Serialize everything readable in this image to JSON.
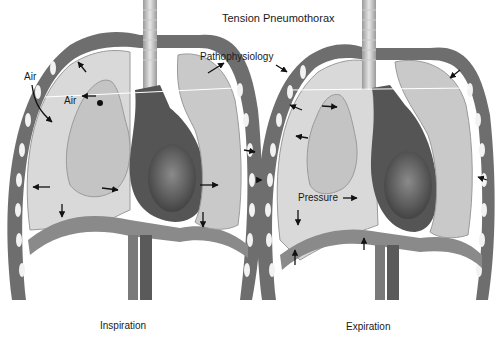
{
  "title": "Tension Pneumothorax",
  "subtitle": "Pathophysiology",
  "panels": [
    {
      "caption": "Inspiration",
      "labels": {
        "air_outer": "Air",
        "air_inner": "Air"
      }
    },
    {
      "caption": "Expiration",
      "labels": {
        "pressure": "Pressure"
      }
    }
  ],
  "colors": {
    "pleural_space": "#d9d9d9",
    "lung": "#c4c4c4",
    "heart": "#4a4a4a",
    "chest_wall": "#6e6e6e",
    "rib": "#f2f2f2",
    "arrow": "#111111"
  }
}
